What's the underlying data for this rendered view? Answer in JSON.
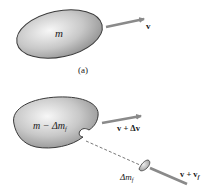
{
  "figure": {
    "panel_a": {
      "caption": "(a)",
      "body_label": "m",
      "velocity_label": "v"
    },
    "panel_b": {
      "body_label_main": "m − Δm",
      "body_label_sub": "f",
      "velocity_label": "v + Δv",
      "fragment_label_main": "Δm",
      "fragment_label_sub": "f",
      "fragment_velocity_main": "v + v",
      "fragment_velocity_sub": "f"
    },
    "colors": {
      "body_fill_light": "#f2f2f2",
      "body_fill_dark": "#9a9a9a",
      "outline": "#3a3a3a",
      "arrow": "#8a8a8a",
      "dashed_line": "#555555"
    }
  }
}
